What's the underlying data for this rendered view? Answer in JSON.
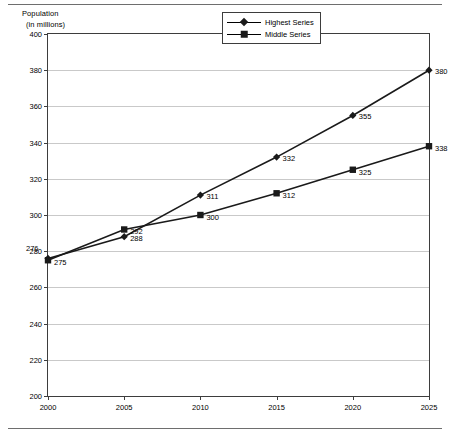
{
  "chart_data": {
    "type": "line",
    "title": "",
    "xlabel": "",
    "ylabel": "Population",
    "ylabel_line1": "Population",
    "ylabel_line2": "(in millions)",
    "categories": [
      "2000",
      "2005",
      "2010",
      "2015",
      "2020",
      "2025"
    ],
    "x": [
      2000,
      2005,
      2010,
      2015,
      2020,
      2025
    ],
    "series": [
      {
        "name": "Highest Series",
        "marker": "diamond",
        "color": "#1a1a1a",
        "values": [
          276,
          288,
          311,
          332,
          355,
          380
        ],
        "labels": [
          "276",
          "288",
          "311",
          "332",
          "355",
          "380"
        ]
      },
      {
        "name": "Middle Series",
        "marker": "square",
        "color": "#1a1a1a",
        "values": [
          275,
          292,
          300,
          312,
          325,
          338
        ],
        "labels": [
          "275",
          "292",
          "300",
          "312",
          "325",
          "338"
        ]
      }
    ],
    "ylim": [
      200,
      400
    ],
    "yticks": [
      400,
      380,
      360,
      340,
      320,
      300,
      280,
      260,
      240,
      220,
      200
    ],
    "ytick_labels": [
      "400",
      "380",
      "360",
      "340",
      "320",
      "300",
      "280",
      "260",
      "240",
      "220",
      "200"
    ],
    "xlim": [
      2000,
      2025
    ],
    "grid": "horizontal",
    "grid_color": "#c9c9c9",
    "legend_position": "top-center",
    "frame_color": "#3d3d3d",
    "background": "#ffffff"
  },
  "legend": {
    "entries": [
      {
        "label": "Highest Series",
        "marker": "diamond"
      },
      {
        "label": "Middle Series",
        "marker": "square"
      }
    ]
  }
}
